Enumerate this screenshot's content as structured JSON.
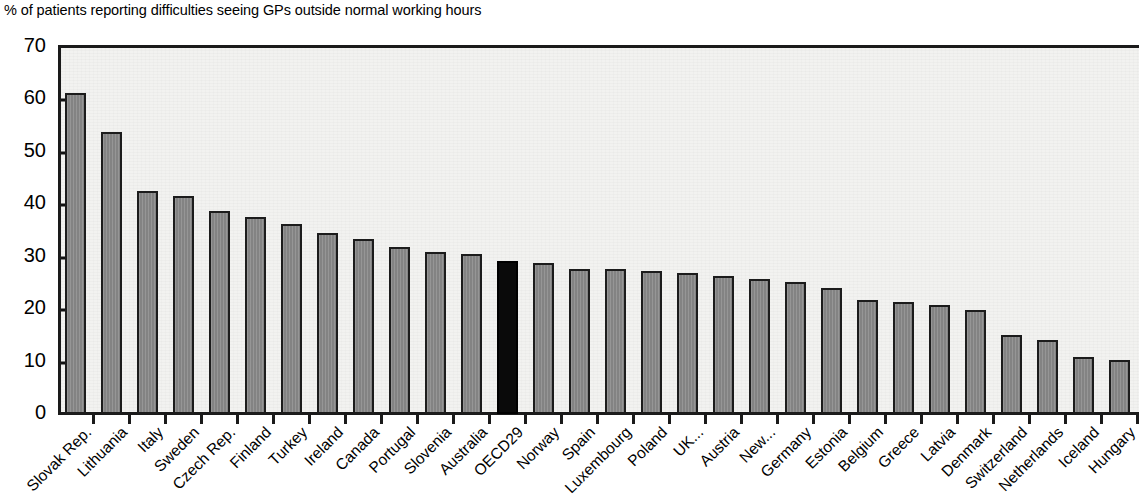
{
  "chart_data": {
    "type": "bar",
    "title": "% of patients reporting difficulties seeing GPs outside normal working hours",
    "xlabel": "",
    "ylabel": "",
    "ylim": [
      0,
      70
    ],
    "ytick_values": [
      0,
      10,
      20,
      30,
      40,
      50,
      60,
      70
    ],
    "ytick_labels": [
      "0",
      "10",
      "20",
      "30",
      "40",
      "50",
      "60",
      "70"
    ],
    "grid": false,
    "legend": null,
    "highlight_category": "OECD29",
    "colors": {
      "bar_fill": "#8a8a8a",
      "bar_edge": "#1c1c1c",
      "highlight_fill": "#0a0a0a",
      "axis": "#1a1a1a",
      "plot_background": "#f2f2f0",
      "text": "#000000"
    },
    "categories": [
      "Slovak Rep.",
      "Lithuania",
      "Italy",
      "Sweden",
      "Czech Rep.",
      "Finland",
      "Turkey",
      "Ireland",
      "Canada",
      "Portugal",
      "Slovenia",
      "Australia",
      "OECD29",
      "Norway",
      "Spain",
      "Luxembourg",
      "Poland",
      "UK...",
      "Austria",
      "New...",
      "Germany",
      "Estonia",
      "Belgium",
      "Greece",
      "Latvia",
      "Denmark",
      "Switzerland",
      "Netherlands",
      "Iceland",
      "Hungary"
    ],
    "values": [
      60.9,
      53.5,
      42.2,
      41.2,
      38.4,
      37.2,
      35.9,
      34.2,
      33.0,
      31.5,
      30.5,
      30.2,
      28.8,
      28.5,
      27.3,
      27.2,
      26.9,
      26.6,
      26.0,
      25.3,
      24.8,
      23.7,
      21.4,
      21.0,
      20.5,
      19.5,
      14.6,
      13.7,
      10.4,
      10.0
    ]
  }
}
